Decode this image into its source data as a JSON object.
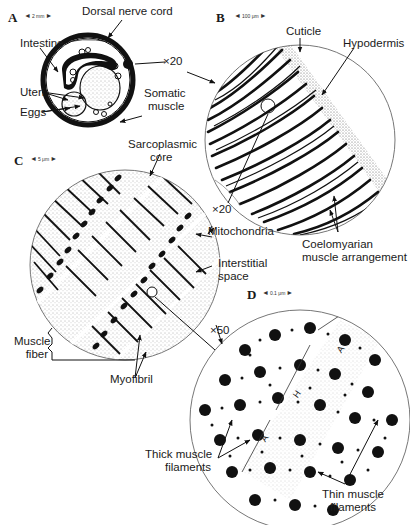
{
  "figure": {
    "panels": [
      {
        "letter": "A",
        "scale": "2 mm"
      },
      {
        "letter": "B",
        "scale": "100 μm"
      },
      {
        "letter": "C",
        "scale": "5 μm"
      },
      {
        "letter": "D",
        "scale": "0.1 μm"
      }
    ],
    "magnifications": [
      "×20",
      "×20",
      "×50"
    ],
    "labels": {
      "dorsal_nerve_cord": "Dorsal nerve cord",
      "intestine": "Intestine",
      "uteri": "Uteri",
      "eggs": "Eggs",
      "somatic_muscle_1": "Somatic",
      "somatic_muscle_2": "muscle",
      "cuticle": "Cuticle",
      "hypodermis": "Hypodermis",
      "coelomyarian_1": "Coelomyarian",
      "coelomyarian_2": "muscle arrangement",
      "sarcoplasmic_1": "Sarcoplasmic",
      "sarcoplasmic_2": "core",
      "mitochondria": "Mitochondria",
      "interstitial_1": "Interstitial",
      "interstitial_2": "space",
      "muscle_fiber_1": "Muscle",
      "muscle_fiber_2": "fiber",
      "myofibril": "Myofibril",
      "thick_1": "Thick muscle",
      "thick_2": "filaments",
      "thin_1": "Thin muscle",
      "thin_2": "filaments",
      "band_a": "A",
      "band_h": "H"
    }
  }
}
